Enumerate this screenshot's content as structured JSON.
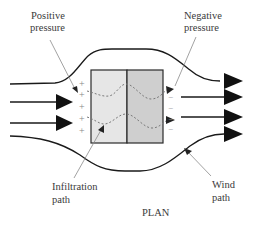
{
  "diagram": {
    "title": "PLAN",
    "labels": {
      "positive_pressure": [
        "Positive",
        "pressure"
      ],
      "negative_pressure": [
        "Negative",
        "pressure"
      ],
      "infiltration_path": [
        "Infiltration",
        "path"
      ],
      "wind_path": [
        "Wind",
        "path"
      ]
    },
    "windward_signs": [
      "+",
      "+",
      "+",
      "+",
      "+"
    ],
    "leeward_signs": [
      "−",
      "−",
      "−",
      "−"
    ],
    "colors": {
      "line": "#1a1a1a",
      "leader": "#8a8a8a",
      "dashed_path": "#7a7a7a",
      "building_windward_half": "#e6e6e6",
      "building_leeward_half": "#cfcfcf",
      "building_outline": "#2a2a2a",
      "text": "#3a3a3a"
    }
  }
}
